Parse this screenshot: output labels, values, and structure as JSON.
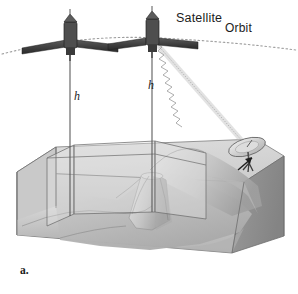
{
  "figure": {
    "panel_label": "a.",
    "caption_labels": {
      "satellite": "Satellite",
      "orbit": "Orbit",
      "height_left": "h",
      "height_right": "h"
    },
    "colors": {
      "background": "#ffffff",
      "block_top_face": "#d9d9d9",
      "block_front_face": "#c2c2c2",
      "block_right_face": "#8f8f8f",
      "terrain_light": "#d2d2d2",
      "terrain_mid": "#bdbdbd",
      "terrain_dark": "#9c9c9c",
      "swath_plane": "#e6e6e6",
      "outline": "#6b6b6b",
      "satellite_body": "#4a4a4a",
      "satellite_panel": "#2e2e2e",
      "dish": "#d0d0d0",
      "beam": "#b4b4b4",
      "orbit_line": "#9a9a9a",
      "text": "#1c1c1c"
    },
    "elements": {
      "satellite_left": {
        "name": "satellite-left",
        "x": 70,
        "y": 40
      },
      "satellite_right": {
        "name": "satellite-right",
        "x": 152,
        "y": 36
      },
      "orbit_path": {
        "name": "orbit-path",
        "style": "dotted-arc"
      },
      "height_line_left": {
        "name": "height-line-left",
        "from_y": 48,
        "to_y": 215
      },
      "height_line_right": {
        "name": "height-line-right",
        "from_y": 44,
        "to_y": 212
      },
      "radar_beam": {
        "name": "radar-beam",
        "style": "zigzag",
        "from": "satellite-right",
        "to": "ground-dish"
      },
      "ground_dish": {
        "name": "ground-dish-antenna",
        "x": 246,
        "y": 147
      },
      "terrain_block": {
        "name": "terrain-block-3d"
      },
      "swath_planes": {
        "name": "swath-planes",
        "count": 3
      }
    }
  }
}
